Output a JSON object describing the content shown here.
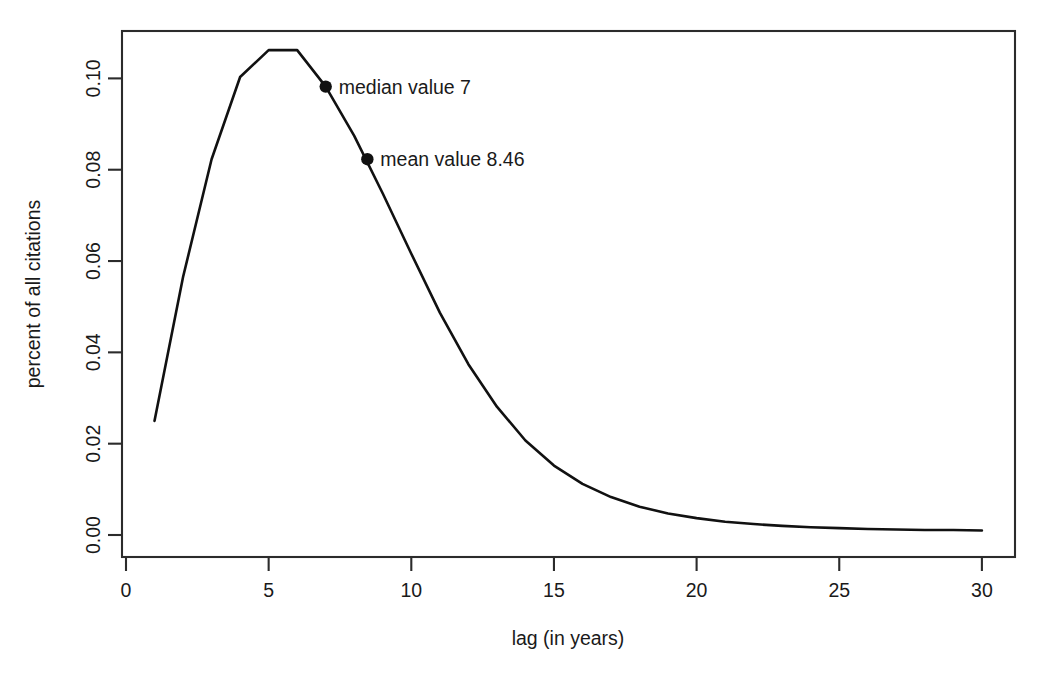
{
  "chart_data": {
    "type": "line",
    "title": "",
    "subtitle": "",
    "xlabel": "lag (in years)",
    "ylabel": "percent of all citations",
    "xlim": [
      0,
      31
    ],
    "ylim": [
      0.0,
      0.1155
    ],
    "grid": false,
    "legend": null,
    "xticks": [
      0,
      5,
      10,
      15,
      20,
      25,
      30
    ],
    "xtick_labels": [
      "0",
      "5",
      "10",
      "15",
      "20",
      "25",
      "30"
    ],
    "yticks": [
      0.0,
      0.02,
      0.04,
      0.06,
      0.08,
      0.1
    ],
    "ytick_labels": [
      "0.00",
      "0.02",
      "0.04",
      "0.06",
      "0.08",
      "0.10"
    ],
    "x": [
      1,
      2,
      3,
      4,
      5,
      6,
      7,
      8,
      9,
      10,
      11,
      12,
      13,
      14,
      15,
      16,
      17,
      18,
      19,
      20,
      21,
      22,
      23,
      24,
      25,
      26,
      27,
      28,
      29,
      30
    ],
    "series": [
      {
        "name": "percent of all citations",
        "values": [
          0.025,
          0.0565,
          0.0823,
          0.1003,
          0.1062,
          0.1062,
          0.0982,
          0.0874,
          0.0748,
          0.0616,
          0.0487,
          0.0374,
          0.0281,
          0.0207,
          0.0152,
          0.0112,
          0.0083,
          0.0062,
          0.0047,
          0.0037,
          0.0029,
          0.0024,
          0.002,
          0.0017,
          0.0015,
          0.0013,
          0.0012,
          0.0011,
          0.0011,
          0.001
        ]
      }
    ],
    "annotations": [
      {
        "name": "median",
        "label": "median value 7",
        "x": 7,
        "y": 0.0982
      },
      {
        "name": "mean",
        "label": "mean value 8.46",
        "x": 8.46,
        "y": 0.0823
      }
    ],
    "colors": {
      "line": "#111111",
      "marker": "#111111",
      "axis": "#2b2b2b",
      "background": "#ffffff"
    }
  }
}
